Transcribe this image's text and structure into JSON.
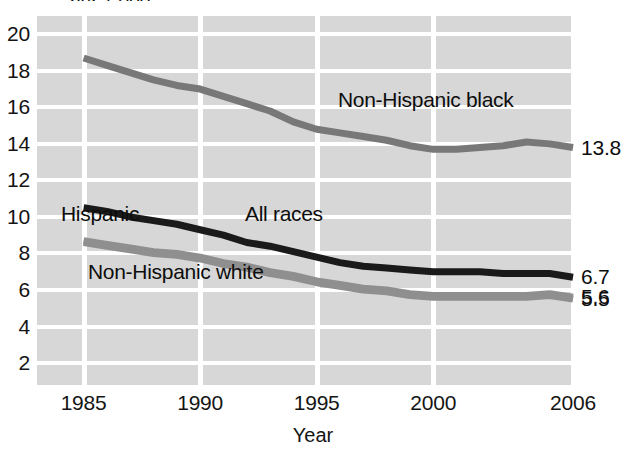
{
  "chart_data": {
    "type": "line",
    "title": "per 1,000",
    "xlabel": "Year",
    "ylabel": "",
    "xlim": [
      1983,
      2006
    ],
    "ylim": [
      0.8,
      21.0
    ],
    "grid": true,
    "legend_position": "inline-annotations",
    "x_ticks": [
      "1985",
      "1990",
      "1995",
      "2000",
      "2006"
    ],
    "x_tick_values": [
      1985,
      1990,
      1995,
      2000,
      2006
    ],
    "y_ticks": [
      "2",
      "4",
      "6",
      "8",
      "10",
      "12",
      "14",
      "16",
      "18",
      "20"
    ],
    "y_tick_values": [
      2,
      4,
      6,
      8,
      10,
      12,
      14,
      16,
      18,
      20
    ],
    "series": [
      {
        "name": "Non-Hispanic black",
        "color": "#787878",
        "end_label": "13.8",
        "x": [
          1985,
          1986,
          1987,
          1988,
          1989,
          1990,
          1991,
          1992,
          1993,
          1994,
          1995,
          1996,
          1997,
          1998,
          1999,
          2000,
          2001,
          2002,
          2003,
          2004,
          2005,
          2006
        ],
        "values": [
          18.7,
          18.3,
          17.9,
          17.5,
          17.2,
          17.0,
          16.6,
          16.2,
          15.8,
          15.2,
          14.8,
          14.6,
          14.4,
          14.2,
          13.9,
          13.7,
          13.7,
          13.8,
          13.9,
          14.1,
          14.0,
          13.8
        ]
      },
      {
        "name": "All races",
        "color": "#1a1a1a",
        "end_label": "6.7",
        "x": [
          1985,
          1986,
          1987,
          1988,
          1989,
          1990,
          1991,
          1992,
          1993,
          1994,
          1995,
          1996,
          1997,
          1998,
          1999,
          2000,
          2001,
          2002,
          2003,
          2004,
          2005,
          2006
        ],
        "values": [
          10.5,
          10.3,
          10.0,
          9.8,
          9.6,
          9.3,
          9.0,
          8.6,
          8.4,
          8.1,
          7.8,
          7.5,
          7.3,
          7.2,
          7.1,
          7.0,
          7.0,
          7.0,
          6.9,
          6.9,
          6.9,
          6.7
        ]
      },
      {
        "name": "Hispanic",
        "color": "#8f8f8f",
        "end_label": "5.6",
        "x": [
          1985,
          1986,
          1987,
          1988,
          1989,
          1990,
          1991,
          1992,
          1993,
          1994,
          1995,
          1996,
          1997,
          1998,
          1999,
          2000,
          2001,
          2002,
          2003,
          2004,
          2005,
          2006
        ],
        "values": [
          8.7,
          8.5,
          8.3,
          8.1,
          8.0,
          7.8,
          7.5,
          7.3,
          7.0,
          6.8,
          6.5,
          6.3,
          6.1,
          6.0,
          5.8,
          5.7,
          5.7,
          5.7,
          5.7,
          5.7,
          5.8,
          5.6
        ]
      },
      {
        "name": "Non-Hispanic white",
        "color": "#8f8f8f",
        "end_label": "5.5",
        "x": [
          1985,
          1986,
          1987,
          1988,
          1989,
          1990,
          1991,
          1992,
          1993,
          1994,
          1995,
          1996,
          1997,
          1998,
          1999,
          2000,
          2001,
          2002,
          2003,
          2004,
          2005,
          2006
        ],
        "values": [
          8.6,
          8.4,
          8.2,
          8.0,
          7.9,
          7.7,
          7.4,
          7.2,
          6.9,
          6.7,
          6.4,
          6.2,
          6.0,
          5.9,
          5.7,
          5.6,
          5.6,
          5.6,
          5.6,
          5.6,
          5.7,
          5.5
        ]
      }
    ],
    "annotations": [
      {
        "text": "Non-Hispanic black",
        "x_px": 338,
        "y_px": 89
      },
      {
        "text": "Hispanic",
        "x_px": 61,
        "y_px": 203
      },
      {
        "text": "All races",
        "x_px": 245,
        "y_px": 203
      },
      {
        "text": "Non-Hispanic white",
        "x_px": 88,
        "y_px": 261
      }
    ]
  }
}
